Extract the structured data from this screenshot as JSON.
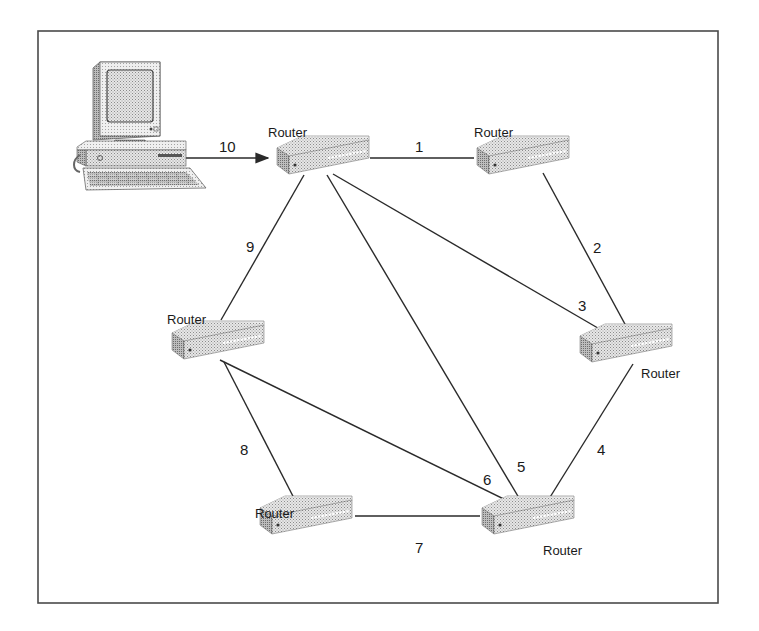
{
  "diagram": {
    "title": "",
    "colors": {
      "line": "#2a2a2a",
      "device_top": "#d0d0d0",
      "device_front": "#a8a8a8",
      "device_side": "#8c8c8c",
      "frame": "#4a4a4a"
    },
    "workstation": {
      "id": "pc",
      "icon": "desktop-computer-icon",
      "x": 130,
      "y": 125
    },
    "routers": [
      {
        "id": "r1",
        "label": "Router",
        "x": 320,
        "y": 160,
        "label_pos": "above"
      },
      {
        "id": "r2",
        "label": "Router",
        "x": 520,
        "y": 160,
        "label_pos": "above"
      },
      {
        "id": "r3",
        "label": "Router",
        "x": 622,
        "y": 348,
        "label_pos": "below-right"
      },
      {
        "id": "r4",
        "label": "Router",
        "x": 215,
        "y": 345,
        "label_pos": "above"
      },
      {
        "id": "r5",
        "label": "Router",
        "x": 305,
        "y": 518,
        "label_pos": "above"
      },
      {
        "id": "r6",
        "label": "Router",
        "x": 527,
        "y": 518,
        "label_pos": "below-right"
      }
    ],
    "links": [
      {
        "label": "1",
        "from": "r1",
        "to": "r2",
        "label_x": 419,
        "label_y": 147
      },
      {
        "label": "2",
        "from": "r2",
        "to": "r3",
        "label_x": 597,
        "label_y": 249
      },
      {
        "label": "3",
        "from": "r1",
        "to": "r3",
        "label_x": 581,
        "label_y": 307
      },
      {
        "label": "4",
        "from": "r3",
        "to": "r6",
        "label_x": 601,
        "label_y": 451
      },
      {
        "label": "5",
        "from": "r1",
        "to": "r6",
        "label_x": 521,
        "label_y": 468
      },
      {
        "label": "6",
        "from": "r4",
        "to": "r6",
        "label_x": 487,
        "label_y": 481
      },
      {
        "label": "7",
        "from": "r5",
        "to": "r6",
        "label_x": 419,
        "label_y": 535
      },
      {
        "label": "8",
        "from": "r4",
        "to": "r5",
        "label_x": 245,
        "label_y": 451
      },
      {
        "label": "9",
        "from": "r4",
        "to": "r1",
        "label_x": 250,
        "label_y": 248
      },
      {
        "label": "10",
        "from": "pc",
        "to": "r1",
        "label_x": 227,
        "label_y": 147,
        "arrow": true
      }
    ]
  }
}
